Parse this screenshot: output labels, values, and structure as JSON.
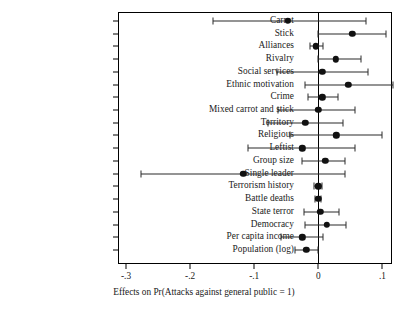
{
  "chart_data": {
    "type": "scatter",
    "title": "",
    "subtitle": "",
    "xlabel": "Effects on Pr(Attacks against general public = 1)",
    "ylabel": "",
    "xlim": [
      -0.3125,
      0.115
    ],
    "xticks": [
      -0.3,
      -0.2,
      -0.1,
      0,
      0.1
    ],
    "xticklabels": [
      "-.3",
      "-.2",
      "-.1",
      "0",
      ".1"
    ],
    "grid": false,
    "legend": null,
    "reference_line": 0,
    "orientation": "horizontal",
    "categories": [
      "Carrot",
      "Stick",
      "Alliances",
      "Rivalry",
      "Social services",
      "Ethnic motivation",
      "Crime",
      "Mixed carrot and stick",
      "Territory",
      "Religious",
      "Leftist",
      "Group size",
      "Single leader",
      "Terrorism history",
      "Battle deaths",
      "State terror",
      "Democracy",
      "Per capita income",
      "Population (log)"
    ],
    "series": [
      {
        "name": "Marginal effect",
        "points": [
          {
            "category": "Carrot",
            "estimate": -0.048,
            "ci_low": -0.164,
            "ci_high": 0.074
          },
          {
            "category": "Stick",
            "estimate": 0.053,
            "ci_low": 0.0,
            "ci_high": 0.105
          },
          {
            "category": "Alliances",
            "estimate": -0.004,
            "ci_low": -0.013,
            "ci_high": 0.008
          },
          {
            "category": "Rivalry",
            "estimate": 0.027,
            "ci_low": 0.0,
            "ci_high": 0.066
          },
          {
            "category": "Social services",
            "estimate": 0.006,
            "ci_low": -0.064,
            "ci_high": 0.078
          },
          {
            "category": "Ethnic motivation",
            "estimate": 0.047,
            "ci_low": -0.02,
            "ci_high": 0.116
          },
          {
            "category": "Crime",
            "estimate": 0.006,
            "ci_low": -0.016,
            "ci_high": 0.03
          },
          {
            "category": "Mixed carrot and stick",
            "estimate": 0.0,
            "ci_low": -0.063,
            "ci_high": 0.058
          },
          {
            "category": "Territory",
            "estimate": -0.02,
            "ci_low": -0.078,
            "ci_high": 0.038
          },
          {
            "category": "Religious",
            "estimate": 0.028,
            "ci_low": -0.044,
            "ci_high": 0.1
          },
          {
            "category": "Leftist",
            "estimate": -0.025,
            "ci_low": -0.109,
            "ci_high": 0.058
          },
          {
            "category": "Group size",
            "estimate": 0.011,
            "ci_low": -0.025,
            "ci_high": 0.042
          },
          {
            "category": "Single leader",
            "estimate": -0.117,
            "ci_low": -0.277,
            "ci_high": 0.042
          },
          {
            "category": "Terrorism history",
            "estimate": 0.0,
            "ci_low": -0.006,
            "ci_high": 0.006
          },
          {
            "category": "Battle deaths",
            "estimate": 0.0,
            "ci_low": -0.005,
            "ci_high": 0.005
          },
          {
            "category": "State terror",
            "estimate": 0.003,
            "ci_low": -0.023,
            "ci_high": 0.033
          },
          {
            "category": "Democracy",
            "estimate": 0.013,
            "ci_low": -0.02,
            "ci_high": 0.044
          },
          {
            "category": "Per capita income",
            "estimate": -0.025,
            "ci_low": -0.058,
            "ci_high": 0.008
          },
          {
            "category": "Population (log)",
            "estimate": -0.019,
            "ci_low": -0.036,
            "ci_high": 0.0
          }
        ]
      }
    ]
  },
  "colors": {
    "point": "#111111",
    "interval": "#2b2b2b",
    "axis": "#000000",
    "background": "#ffffff"
  }
}
